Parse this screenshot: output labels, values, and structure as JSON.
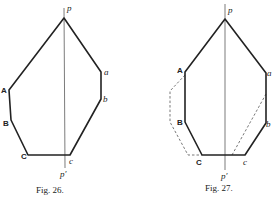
{
  "figures": [
    {
      "caption": "Fig. 26.",
      "axis_labels": {
        "top": "p",
        "bottom": "p′"
      },
      "vertex_labels": {
        "A": "A",
        "B": "B",
        "C": "C",
        "a": "a",
        "b": "b",
        "c": "c"
      }
    },
    {
      "caption": "Fig. 27.",
      "axis_labels": {
        "top": "p",
        "bottom": "p′"
      },
      "vertex_labels": {
        "A": "A",
        "B": "B",
        "C": "C",
        "a": "a",
        "b": "b",
        "c": "c"
      }
    }
  ]
}
